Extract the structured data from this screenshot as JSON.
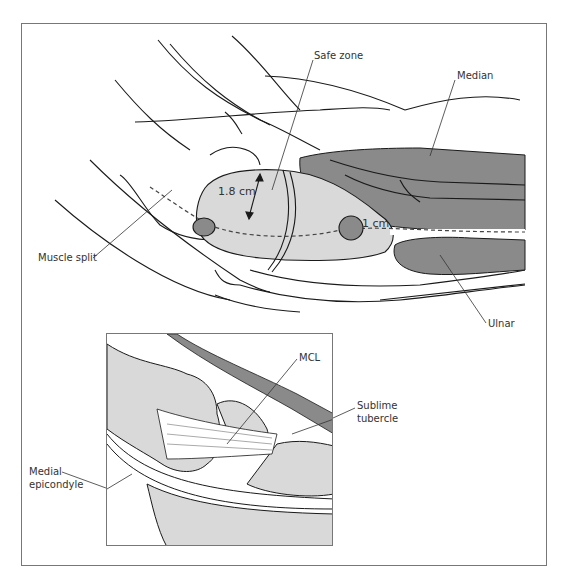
{
  "figure": {
    "type": "medical illustration",
    "colors": {
      "light_tissue": "#d9d9d9",
      "dark_muscle": "#8a8a8a",
      "line": "#1a1a1a",
      "frame": "#777777"
    }
  },
  "main_view": {
    "labels": {
      "safe_zone": "Safe zone",
      "median": "Median",
      "muscle_split": "Muscle split",
      "ulnar": "Ulnar",
      "measure_1": "1.8 cm",
      "measure_2": "1 cm"
    }
  },
  "inset_view": {
    "labels": {
      "mcl": "MCL",
      "sublime_tubercle_line1": "Sublime",
      "sublime_tubercle_line2": "tubercle",
      "medial_epicondyle_line1": "Medial",
      "medial_epicondyle_line2": "epicondyle"
    }
  }
}
